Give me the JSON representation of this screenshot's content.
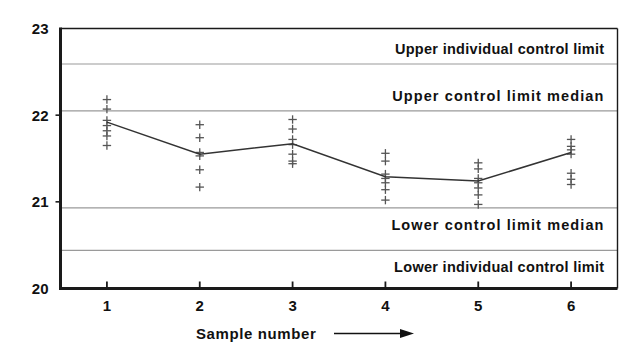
{
  "chart_data": {
    "type": "scatter",
    "title": "",
    "xlabel": "Sample number",
    "ylabel": "",
    "xlim": [
      0.5,
      6.5
    ],
    "ylim": [
      20,
      23
    ],
    "grid": true,
    "legend": "none",
    "x_tick_labels": [
      "1",
      "2",
      "3",
      "4",
      "5",
      "6"
    ],
    "x_tick_values": [
      1,
      2,
      3,
      4,
      5,
      6
    ],
    "y_tick_labels": [
      "20",
      "21",
      "22",
      "23"
    ],
    "y_tick_values": [
      20,
      21,
      22,
      23
    ],
    "control_limits": [
      {
        "name": "upper-individual-control-limit",
        "label": "Upper individual control limit",
        "value": 22.59
      },
      {
        "name": "upper-control-limit-median",
        "label": "Upper control limit  median",
        "value": 22.05
      },
      {
        "name": "lower-control-limit-median",
        "label": "Lower control limit  median",
        "value": 20.93
      },
      {
        "name": "lower-individual-control-limit",
        "label": "Lower individual control limit",
        "value": 20.44
      }
    ],
    "median_series": {
      "name": "Sample median",
      "x": [
        1,
        2,
        3,
        4,
        5,
        6
      ],
      "values": [
        21.92,
        21.55,
        21.67,
        21.29,
        21.24,
        21.57
      ]
    },
    "samples": [
      {
        "sample": 1,
        "observations": [
          22.18,
          22.07,
          21.94,
          21.88,
          21.82,
          21.76,
          21.65
        ]
      },
      {
        "sample": 2,
        "observations": [
          21.89,
          21.74,
          21.57,
          21.53,
          21.37,
          21.17
        ]
      },
      {
        "sample": 3,
        "observations": [
          21.95,
          21.84,
          21.72,
          21.66,
          21.55,
          21.47,
          21.44
        ]
      },
      {
        "sample": 4,
        "observations": [
          21.56,
          21.47,
          21.32,
          21.27,
          21.22,
          21.14,
          21.02
        ]
      },
      {
        "sample": 5,
        "observations": [
          21.45,
          21.38,
          21.27,
          21.22,
          21.16,
          21.08,
          20.97
        ]
      },
      {
        "sample": 6,
        "observations": [
          21.72,
          21.64,
          21.6,
          21.55,
          21.33,
          21.26,
          21.2
        ]
      }
    ],
    "arrow_annotation": "sample-number-direction-arrow"
  },
  "style": {
    "frame_color": "#1a1a1a",
    "gridline_color": "#9a9a9a",
    "marker_color": "#555555",
    "line_color": "#333333",
    "background": "#ffffff"
  }
}
